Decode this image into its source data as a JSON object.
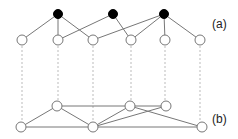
{
  "labels": {
    "a": "(a)",
    "b": "(b)"
  },
  "diagram": {
    "top_nodes_black": [
      [
        58,
        14
      ],
      [
        113,
        14
      ],
      [
        164,
        14
      ]
    ],
    "top_nodes_white": [
      [
        22,
        40
      ],
      [
        58,
        40
      ],
      [
        93,
        40
      ],
      [
        131,
        40
      ],
      [
        165,
        40
      ],
      [
        200,
        40
      ]
    ],
    "bottom_nodes": {
      "U1": [
        57,
        106
      ],
      "U2": [
        130,
        106
      ],
      "U3": [
        166,
        106
      ],
      "L1": [
        21,
        127
      ],
      "L2": [
        93,
        127
      ],
      "L3": [
        202,
        127
      ]
    },
    "edges_a": [
      [
        0,
        0
      ],
      [
        0,
        1
      ],
      [
        0,
        2
      ],
      [
        1,
        1
      ],
      [
        1,
        3
      ],
      [
        2,
        2
      ],
      [
        2,
        3
      ],
      [
        2,
        4
      ],
      [
        2,
        5
      ]
    ],
    "edges_b": [
      [
        "L1",
        "U1"
      ],
      [
        "U1",
        "U2"
      ],
      [
        "U1",
        "L2"
      ],
      [
        "L1",
        "L3"
      ],
      [
        "U2",
        "U3"
      ],
      [
        "U2",
        "L2"
      ],
      [
        "U2",
        "L3"
      ],
      [
        "U3",
        "L2"
      ]
    ]
  }
}
